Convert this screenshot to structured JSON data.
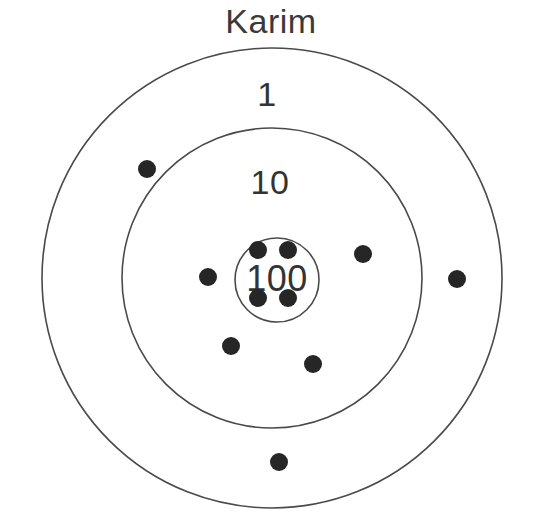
{
  "title": "Karim",
  "colors": {
    "background": "#ffffff",
    "ring_stroke": "#4a4a4a",
    "dot_fill": "#262626",
    "label_text": "#333333",
    "title_text": "#3a3a3a"
  },
  "chart_data": {
    "type": "scatter",
    "title": "Karim",
    "subtitle": "",
    "xlabel": "",
    "ylabel": "",
    "grid": false,
    "legend": "none",
    "center": {
      "x": 272,
      "y": 278
    },
    "rings": [
      {
        "label": "1",
        "value": 1,
        "radius": 230,
        "label_x": 267,
        "label_y": 97
      },
      {
        "label": "10",
        "value": 10,
        "radius": 150,
        "label_x": 270,
        "label_y": 185
      },
      {
        "label": "100",
        "value": 100,
        "radius": 42,
        "label_x": 277,
        "label_y": 281
      }
    ],
    "dot_radius": 9,
    "points": [
      {
        "x": 258,
        "y": 250,
        "zone": "100",
        "value": 100
      },
      {
        "x": 288,
        "y": 250,
        "zone": "100",
        "value": 100
      },
      {
        "x": 258,
        "y": 298,
        "zone": "100",
        "value": 100
      },
      {
        "x": 288,
        "y": 298,
        "zone": "100",
        "value": 100
      },
      {
        "x": 208,
        "y": 277,
        "zone": "10",
        "value": 10
      },
      {
        "x": 363,
        "y": 254,
        "zone": "10",
        "value": 10
      },
      {
        "x": 231,
        "y": 346,
        "zone": "10",
        "value": 10
      },
      {
        "x": 313,
        "y": 364,
        "zone": "10",
        "value": 10
      },
      {
        "x": 147,
        "y": 169,
        "zone": "1",
        "value": 1
      },
      {
        "x": 457,
        "y": 279,
        "zone": "1",
        "value": 1
      },
      {
        "x": 279,
        "y": 462,
        "zone": "1",
        "value": 1
      }
    ],
    "counts": {
      "zone_100": 4,
      "zone_10": 4,
      "zone_1": 3,
      "total_darts": 11
    }
  }
}
